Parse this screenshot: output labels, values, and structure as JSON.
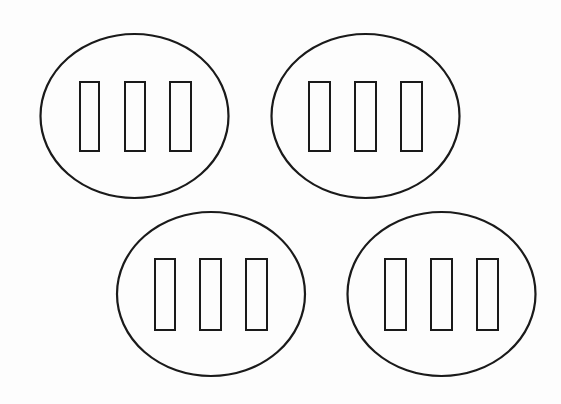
{
  "diagram": {
    "colors": {
      "background": "#fdfdfd",
      "stroke": "#1a1a1a"
    },
    "groups": [
      {
        "id": "group-1",
        "ellipse": {
          "cx": 134.5,
          "cy": 116,
          "rx": 94,
          "ry": 82
        },
        "rects": [
          {
            "x": 80,
            "y": 82,
            "w": 19,
            "h": 69
          },
          {
            "x": 125,
            "y": 82,
            "w": 20,
            "h": 69
          },
          {
            "x": 170,
            "y": 82,
            "w": 21,
            "h": 69
          }
        ]
      },
      {
        "id": "group-2",
        "ellipse": {
          "cx": 365.5,
          "cy": 116,
          "rx": 94,
          "ry": 82
        },
        "rects": [
          {
            "x": 309,
            "y": 82,
            "w": 21,
            "h": 69
          },
          {
            "x": 355,
            "y": 82,
            "w": 21,
            "h": 69
          },
          {
            "x": 401,
            "y": 82,
            "w": 21,
            "h": 69
          }
        ]
      },
      {
        "id": "group-3",
        "ellipse": {
          "cx": 211,
          "cy": 294,
          "rx": 94,
          "ry": 82
        },
        "rects": [
          {
            "x": 155,
            "y": 259,
            "w": 20,
            "h": 71
          },
          {
            "x": 200,
            "y": 259,
            "w": 21,
            "h": 71
          },
          {
            "x": 246,
            "y": 259,
            "w": 21,
            "h": 71
          }
        ]
      },
      {
        "id": "group-4",
        "ellipse": {
          "cx": 441.5,
          "cy": 294,
          "rx": 94,
          "ry": 82
        },
        "rects": [
          {
            "x": 385,
            "y": 259,
            "w": 21,
            "h": 71
          },
          {
            "x": 431,
            "y": 259,
            "w": 21,
            "h": 71
          },
          {
            "x": 477,
            "y": 259,
            "w": 21,
            "h": 71
          }
        ]
      }
    ]
  }
}
